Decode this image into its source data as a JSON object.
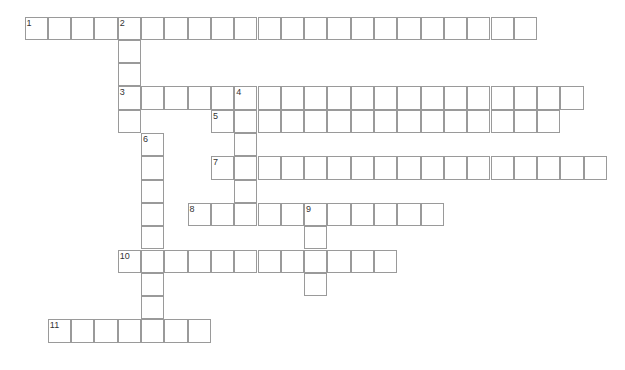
{
  "puzzle": {
    "type": "crossword",
    "origin": {
      "x": 25,
      "y": 17
    },
    "cell_size": 23.3,
    "border_color": "#9a9a9a",
    "entries": [
      {
        "number": "1",
        "direction": "across",
        "row": 0,
        "col": 0,
        "length": 22
      },
      {
        "number": "2",
        "direction": "down",
        "row": 0,
        "col": 4,
        "length": 5
      },
      {
        "number": "3",
        "direction": "across",
        "row": 3,
        "col": 4,
        "length": 20
      },
      {
        "number": "4",
        "direction": "down",
        "row": 3,
        "col": 9,
        "length": 6
      },
      {
        "number": "5",
        "direction": "across",
        "row": 4,
        "col": 8,
        "length": 15
      },
      {
        "number": "6",
        "direction": "down",
        "row": 5,
        "col": 5,
        "length": 9
      },
      {
        "number": "7",
        "direction": "across",
        "row": 6,
        "col": 8,
        "length": 17
      },
      {
        "number": "8",
        "direction": "across",
        "row": 8,
        "col": 7,
        "length": 11
      },
      {
        "number": "9",
        "direction": "down",
        "row": 8,
        "col": 12,
        "length": 4
      },
      {
        "number": "10",
        "direction": "across",
        "row": 10,
        "col": 4,
        "length": 12
      },
      {
        "number": "11",
        "direction": "across",
        "row": 13,
        "col": 1,
        "length": 7
      }
    ]
  }
}
